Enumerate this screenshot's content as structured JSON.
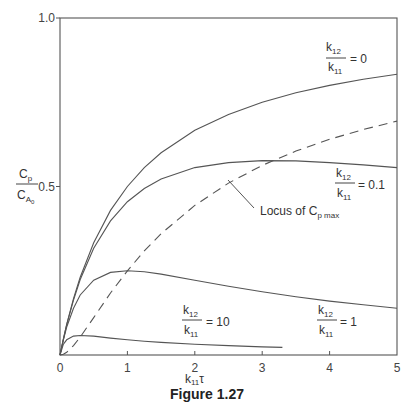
{
  "figure_caption": "Figure 1.27",
  "chart_data": {
    "type": "line",
    "title": "",
    "xlabel": "k11τ",
    "ylabel": "Cp / CA0",
    "xlim": [
      0,
      5
    ],
    "ylim": [
      0,
      1.0
    ],
    "x_ticks": [
      "0",
      "1",
      "2",
      "3",
      "4",
      "5"
    ],
    "y_ticks": [
      "0.5",
      "1.0"
    ],
    "grid": false,
    "legend": "inline labels",
    "x": [
      0,
      0.05,
      0.1,
      0.2,
      0.3,
      0.5,
      0.75,
      1.0,
      1.25,
      1.5,
      2.0,
      2.5,
      3.0,
      3.5,
      4.0,
      4.5,
      5.0
    ],
    "series": [
      {
        "name": "k12/k11 = 0",
        "style": "solid",
        "values": [
          0,
          0.048,
          0.091,
          0.167,
          0.231,
          0.333,
          0.429,
          0.5,
          0.556,
          0.6,
          0.667,
          0.714,
          0.75,
          0.778,
          0.8,
          0.818,
          0.833
        ]
      },
      {
        "name": "k12/k11 = 0.1",
        "style": "solid",
        "values": [
          0,
          0.047,
          0.09,
          0.163,
          0.224,
          0.317,
          0.398,
          0.455,
          0.494,
          0.522,
          0.556,
          0.571,
          0.577,
          0.576,
          0.571,
          0.564,
          0.556
        ]
      },
      {
        "name": "k12/k11 = 1",
        "style": "solid",
        "values": [
          0,
          0.045,
          0.083,
          0.139,
          0.178,
          0.222,
          0.245,
          0.25,
          0.247,
          0.24,
          0.222,
          0.204,
          0.1875,
          0.173,
          0.16,
          0.149,
          0.139
        ]
      },
      {
        "name": "k12/k11 = 10",
        "style": "solid",
        "x_end": 3.3,
        "values": [
          0,
          0.032,
          0.045,
          0.056,
          0.058,
          0.056,
          0.05,
          0.045,
          0.041,
          0.0375,
          0.032,
          0.028,
          0.024,
          null,
          null,
          null,
          null
        ]
      },
      {
        "name": "Locus of Cp max",
        "style": "dashed",
        "values": [
          0,
          0.002,
          0.008,
          0.028,
          0.053,
          0.111,
          0.184,
          0.25,
          0.309,
          0.36,
          0.444,
          0.51,
          0.5625,
          0.605,
          0.64,
          0.669,
          0.694
        ]
      }
    ],
    "annotations": [
      {
        "text": "k12/k11 = 0",
        "near_x": 4.0,
        "near_y": 0.9
      },
      {
        "text": "k12/k11 = 0.1",
        "near_x": 4.3,
        "near_y": 0.48
      },
      {
        "text": "k12/k11 = 1",
        "near_x": 3.9,
        "near_y": 0.13
      },
      {
        "text": "k12/k11 = 10",
        "near_x": 1.6,
        "near_y": 0.1
      },
      {
        "text": "Locus of Cp max",
        "near_x": 3.0,
        "near_y": 0.42
      }
    ]
  },
  "labels": {
    "y_axis_num": "C",
    "y_axis_num_sub": "p",
    "y_axis_den": "C",
    "y_axis_den_sub": "A",
    "y_axis_den_subsub": "0",
    "x_axis_main": "k",
    "x_axis_sub": "11",
    "x_axis_tau": "τ",
    "frac_num": "k",
    "frac_num_sub": "12",
    "frac_den": "k",
    "frac_den_sub": "11",
    "eq0": "= 0",
    "eq01": "= 0.1",
    "eq1": "= 1",
    "eq10": "= 10",
    "locus": "Locus of C",
    "locus_sub": "p max"
  }
}
